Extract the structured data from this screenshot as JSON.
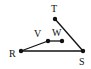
{
  "diagram": {
    "points": [
      {
        "id": "T",
        "label": "T",
        "x": 55,
        "y": 19,
        "lx": 51,
        "ly": 12
      },
      {
        "id": "V",
        "label": "V",
        "x": 48,
        "y": 41,
        "lx": 34,
        "ly": 37
      },
      {
        "id": "W",
        "label": "W",
        "x": 62,
        "y": 41,
        "lx": 52,
        "ly": 36
      },
      {
        "id": "R",
        "label": "R",
        "x": 21,
        "y": 51,
        "lx": 9,
        "ly": 57
      },
      {
        "id": "S",
        "label": "S",
        "x": 83,
        "y": 51,
        "lx": 79,
        "ly": 65
      }
    ],
    "segments": [
      {
        "from": "R",
        "to": "V"
      },
      {
        "from": "V",
        "to": "W"
      },
      {
        "from": "T",
        "to": "S"
      },
      {
        "from": "R",
        "to": "S"
      }
    ]
  }
}
